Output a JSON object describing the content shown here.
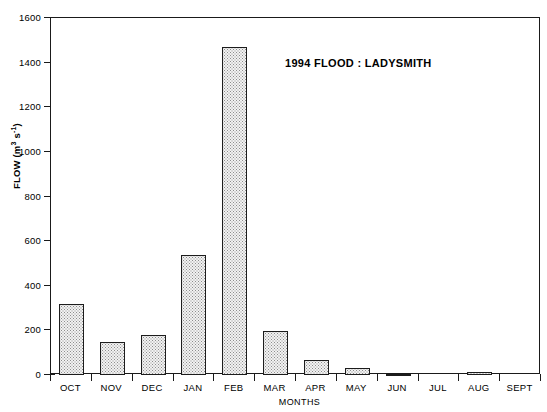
{
  "chart_data": {
    "type": "bar",
    "title": "1994 FLOOD : LADYSMITH",
    "xlabel": "MONTHS",
    "ylabel": "FLOW (m3 s-1)",
    "ylabel_parts": {
      "prefix": "FLOW (m",
      "exp1": "3",
      "mid": " s",
      "exp2": "-1",
      "suffix": ")"
    },
    "categories": [
      "OCT",
      "NOV",
      "DEC",
      "JAN",
      "FEB",
      "MAR",
      "APR",
      "MAY",
      "JUN",
      "JUL",
      "AUG",
      "SEPT"
    ],
    "values": [
      320,
      150,
      178,
      540,
      1470,
      197,
      65,
      30,
      6,
      0,
      12,
      0
    ],
    "ylim": [
      0,
      1600
    ],
    "ytick_values": [
      0,
      200,
      400,
      600,
      800,
      1000,
      1200,
      1400,
      1600
    ],
    "ytick_labels": [
      "0",
      "200",
      "400",
      "600",
      "800",
      "1000",
      "1200",
      "1400",
      "1600"
    ],
    "grid": false,
    "legend": false,
    "bar_fill": "#f2f2f2",
    "bar_edge": "#1c1c1c",
    "axis_color": "#1a1a1a",
    "background": "#ffffff"
  }
}
